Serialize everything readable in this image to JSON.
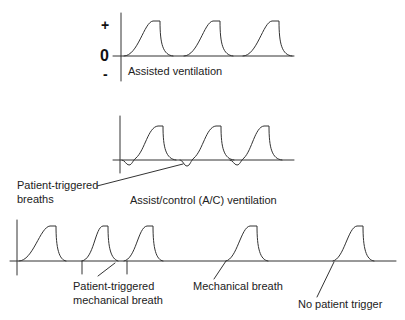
{
  "figure": {
    "panels": [
      {
        "id": "assisted",
        "caption": "Assisted ventilation",
        "axis_labels": {
          "positive": "+",
          "zero": "0",
          "negative": "-"
        }
      },
      {
        "id": "assist-control",
        "caption": "Assist/control (A/C) ventilation",
        "annotations": [
          {
            "text_line1": "Patient-triggered",
            "text_line2": "breaths"
          }
        ]
      },
      {
        "id": "mechanical-timeline",
        "annotations": [
          {
            "text_line1": "Patient-triggered",
            "text_line2": "mechanical breath"
          },
          {
            "text": "Mechanical breath"
          },
          {
            "text": "No patient trigger"
          }
        ]
      }
    ],
    "line_color": "#333333",
    "background": "#ffffff"
  }
}
